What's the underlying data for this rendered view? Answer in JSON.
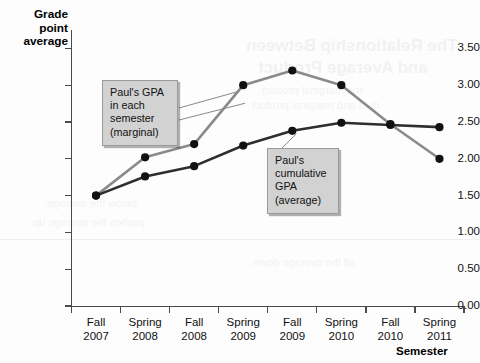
{
  "chart_data": {
    "type": "line",
    "title": "",
    "xlabel": "Semester",
    "ylabel": "Grade point average",
    "categories": [
      "Fall 2007",
      "Spring 2008",
      "Fall 2008",
      "Spring 2009",
      "Fall 2009",
      "Spring 2010",
      "Fall 2010",
      "Spring 2011"
    ],
    "category_lines": [
      [
        "Fall",
        "2007"
      ],
      [
        "Spring",
        "2008"
      ],
      [
        "Fall",
        "2008"
      ],
      [
        "Spring",
        "2009"
      ],
      [
        "Fall",
        "2009"
      ],
      [
        "Spring",
        "2010"
      ],
      [
        "Fall",
        "2010"
      ],
      [
        "Spring",
        "2011"
      ]
    ],
    "ylim": [
      0.0,
      3.75
    ],
    "yticks": [
      "0.00",
      "0.50",
      "1.00",
      "1.50",
      "2.00",
      "2.50",
      "3.00",
      "3.50"
    ],
    "ytick_values": [
      0.0,
      0.5,
      1.0,
      1.5,
      2.0,
      2.5,
      3.0,
      3.5
    ],
    "grid": false,
    "legend": "none",
    "series": [
      {
        "name": "Paul's GPA in each semester (marginal)",
        "color": "#8a8a8a",
        "marker_color": "#111111",
        "values": [
          1.5,
          2.02,
          2.2,
          3.0,
          3.2,
          3.0,
          2.47,
          2.0
        ]
      },
      {
        "name": "Paul's cumulative GPA (average)",
        "color": "#2e2e2e",
        "marker_color": "#111111",
        "values": [
          1.5,
          1.76,
          1.9,
          2.18,
          2.38,
          2.49,
          2.46,
          2.43
        ]
      }
    ],
    "annotations": [
      {
        "id": "marginal",
        "lines": [
          "Paul's GPA",
          "in each",
          "semester",
          "(marginal)"
        ],
        "target_category": "Spring 2009"
      },
      {
        "id": "cumulative",
        "lines": [
          "Paul's",
          "cumulative",
          "GPA",
          "(average)"
        ],
        "target_category": "Fall 2009"
      }
    ]
  },
  "background_bleed": {
    "title_line_1": "The Relationship Between",
    "title_line_2": "and Average Product",
    "body_lines": [
      "the marginal product",
      "duct and marginal product",
      "pushes the average up.",
      "below the average,",
      "ull the average down."
    ]
  }
}
